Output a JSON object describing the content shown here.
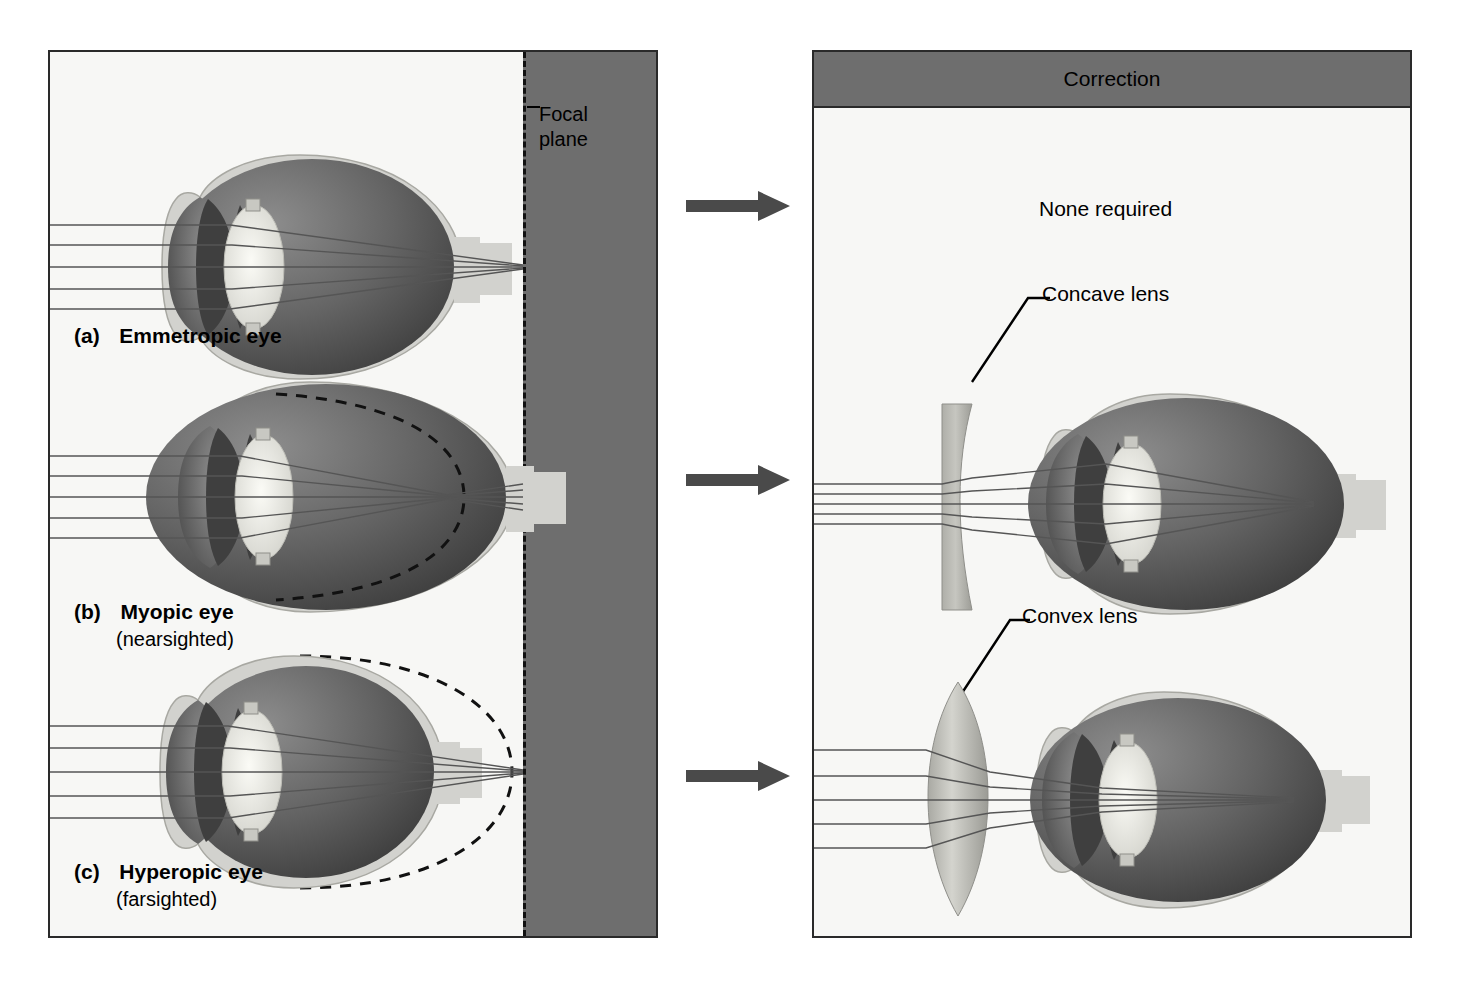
{
  "figure": {
    "background": "#ffffff"
  },
  "colors": {
    "panel_fill": "#f7f7f5",
    "panel_border": "#2a2a2a",
    "dark_band": "#6e6e6e",
    "header_band": "#6e6e6e",
    "arrow": "#4a4a4a",
    "ray": "#555555",
    "sclera": "#d2d2ce",
    "vitreous_dark": "#585858",
    "lens_light": "#efefe8",
    "iris_dark": "#4a4a4a",
    "correction_lens": "#b9b9b4",
    "dash_line": "#111111"
  },
  "left_panel": {
    "name": "eye-conditions-panel",
    "focal_plane_label": "Focal\nplane",
    "focal_plane_line1": "Focal",
    "focal_plane_line2": "plane",
    "rows": [
      {
        "id": "a",
        "marker": "(a)",
        "title": "Emmetropic eye",
        "subtitle": "",
        "condition": "normal",
        "focus_point": "on retina",
        "eye_shape": "spherical",
        "reference_outline": "none"
      },
      {
        "id": "b",
        "marker": "(b)",
        "title": "Myopic eye",
        "subtitle": "(nearsighted)",
        "condition": "nearsighted",
        "focus_point": "in front of retina",
        "eye_shape": "elongated",
        "reference_outline": "dashed arc of normal eyeball"
      },
      {
        "id": "c",
        "marker": "(c)",
        "title": "Hyperopic eye",
        "subtitle": "(farsighted)",
        "condition": "farsighted",
        "focus_point": "behind retina",
        "eye_shape": "shortened",
        "reference_outline": "dashed oval of normal eyeball"
      }
    ],
    "light_rays_count": 5
  },
  "right_panel": {
    "name": "correction-panel",
    "header": "Correction",
    "rows": [
      {
        "id": "a",
        "correction_text": "None required",
        "lens": null
      },
      {
        "id": "b",
        "correction_text": "",
        "lens": "Concave lens"
      },
      {
        "id": "c",
        "correction_text": "",
        "lens": "Convex lens"
      }
    ]
  },
  "arrows": {
    "name": "flow-arrow",
    "count": 3,
    "direction": "right"
  },
  "icons": {
    "arrow_right": "arrow-right-icon",
    "eye": "eye-diagram-icon",
    "concave_lens": "concave-lens-icon",
    "convex_lens": "convex-lens-icon"
  }
}
